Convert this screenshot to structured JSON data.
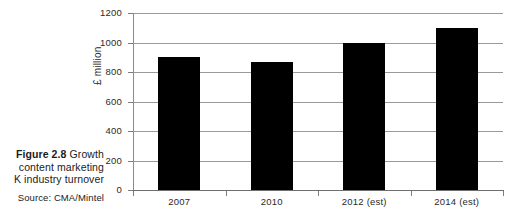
{
  "caption": {
    "figure_label": "Figure 2.8",
    "line1_rest": "Growth",
    "line2": "content marketing",
    "line3": "K industry turnover",
    "source": "Source: CMA/Mintel"
  },
  "chart_data": {
    "type": "bar",
    "title": "",
    "xlabel": "",
    "ylabel": "£ million",
    "categories": [
      "2007",
      "2010",
      "2012 (est)",
      "2014 (est)"
    ],
    "values": [
      900,
      870,
      995,
      1100
    ],
    "ylim": [
      0,
      1200
    ],
    "ytick_values": [
      0,
      200,
      400,
      600,
      800,
      1000,
      1200
    ],
    "ytick_labels": [
      "0",
      "200",
      "400",
      "600",
      "800",
      "1000",
      "1200"
    ],
    "grid": true,
    "legend": "none",
    "bar_color": "#000000",
    "grid_color": "#9a9a9a"
  }
}
